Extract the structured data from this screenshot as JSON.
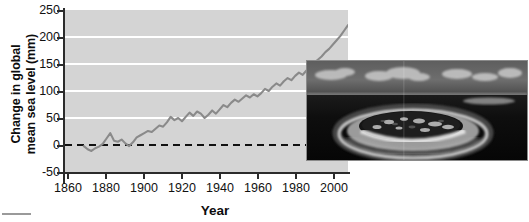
{
  "chart_data": {
    "type": "line",
    "title": "",
    "xlabel": "Year",
    "ylabel_line1": "Change in global",
    "ylabel_line2": "mean sea level (mm)",
    "xlim": [
      1860,
      2010
    ],
    "ylim": [
      -50,
      250
    ],
    "xticks": [
      1860,
      1880,
      1900,
      1920,
      1940,
      1960,
      1980,
      2000
    ],
    "yticks": [
      250,
      200,
      150,
      100,
      50,
      0,
      -50
    ],
    "grid": "horizontal-white-gridlines-at-yticks",
    "legend": "none",
    "zero_reference_line": {
      "value": 0,
      "style": "dashed",
      "color": "#111111"
    },
    "series": [
      {
        "name": "Global mean sea level change",
        "color": "#8a8a8a",
        "x": [
          1870,
          1872,
          1874,
          1876,
          1878,
          1880,
          1882,
          1884,
          1886,
          1888,
          1890,
          1892,
          1894,
          1896,
          1898,
          1900,
          1902,
          1904,
          1906,
          1908,
          1910,
          1912,
          1914,
          1916,
          1918,
          1920,
          1922,
          1924,
          1926,
          1928,
          1930,
          1932,
          1934,
          1936,
          1938,
          1940,
          1942,
          1944,
          1946,
          1948,
          1950,
          1952,
          1954,
          1956,
          1958,
          1960,
          1962,
          1964,
          1966,
          1968,
          1970,
          1972,
          1974,
          1976,
          1978,
          1980,
          1982,
          1984,
          1986,
          1988,
          1990,
          1992,
          1994,
          1996,
          1998,
          2000,
          2002,
          2004,
          2006,
          2008,
          2010
        ],
        "y": [
          -2,
          -8,
          -11,
          -6,
          -3,
          2,
          12,
          22,
          8,
          6,
          10,
          3,
          -2,
          5,
          14,
          18,
          22,
          26,
          24,
          30,
          36,
          34,
          42,
          52,
          46,
          50,
          44,
          52,
          60,
          54,
          62,
          58,
          50,
          56,
          64,
          58,
          66,
          74,
          70,
          78,
          84,
          80,
          86,
          92,
          88,
          94,
          90,
          96,
          104,
          100,
          108,
          114,
          110,
          118,
          124,
          120,
          128,
          134,
          130,
          138,
          146,
          152,
          158,
          164,
          172,
          178,
          186,
          194,
          202,
          212,
          222
        ]
      }
    ]
  },
  "inset_photo": {
    "name": "aerial-photo-low-lying-coral-atoll",
    "alt": "Aerial black and white photograph of a low-lying coral atoll island surrounded by reef and ocean, with clouds on the horizon",
    "caption": ""
  },
  "artifact": {
    "name": "scan-artifact-mark"
  }
}
